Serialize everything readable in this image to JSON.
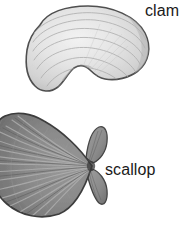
{
  "figure": {
    "background_color": "#ffffff",
    "width": 191,
    "height": 229,
    "style": "grayscale pencil/halftone scientific illustration"
  },
  "labels": {
    "clam": "clam",
    "scallop": "scallop"
  },
  "specimens": [
    {
      "name": "clam",
      "label": "clam",
      "position": "top",
      "outline_color": "#4a4a4a",
      "fill_color": "#e6e6e6",
      "shading_color": "#c9c9c9",
      "texture": "concentric growth rings",
      "features": "oval shell with ventral notch near umbo"
    },
    {
      "name": "scallop",
      "label": "scallop",
      "position": "bottom",
      "outline_color": "#3d3d3d",
      "fill_color": "#8a8a8a",
      "shading_color": "#6b6b6b",
      "texture": "radial ribs converging at hinge",
      "features": "fan-shaped shell with two auricles (ears) at hinge"
    }
  ]
}
